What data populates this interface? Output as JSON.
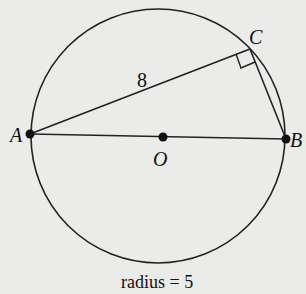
{
  "diagram": {
    "points": {
      "A": {
        "label": "A"
      },
      "B": {
        "label": "B"
      },
      "C": {
        "label": "C"
      },
      "O": {
        "label": "O"
      }
    },
    "segments": {
      "AC": {
        "length_label": "8"
      }
    },
    "right_angle_at": "C",
    "caption": "radius = 5"
  },
  "colors": {
    "background": "#ebebe9",
    "ink": "#111111"
  }
}
